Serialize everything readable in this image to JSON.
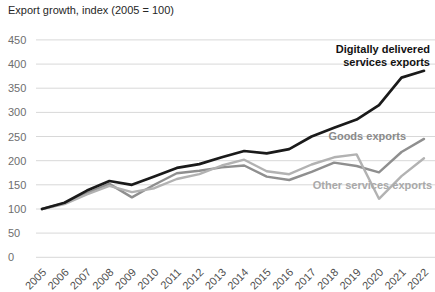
{
  "chart_data": {
    "type": "line",
    "title": "Export growth, index (2005 = 100)",
    "xlabel": "",
    "ylabel": "",
    "ylim": [
      0,
      450
    ],
    "yticks": [
      0,
      50,
      100,
      150,
      200,
      250,
      300,
      350,
      400,
      450
    ],
    "grid": "horizontal",
    "legend_position": "inline-annotations",
    "categories": [
      "2005",
      "2006",
      "2007",
      "2008",
      "2009",
      "2010",
      "2011",
      "2012",
      "2013",
      "2014",
      "2015",
      "2016",
      "2017",
      "2018",
      "2019",
      "2020",
      "2021",
      "2022"
    ],
    "series": [
      {
        "id": "dds",
        "name": "Digitally delivered services exports",
        "color": "#1a1a1a",
        "values": [
          100,
          113,
          138,
          158,
          150,
          167,
          185,
          193,
          207,
          220,
          215,
          224,
          250,
          268,
          285,
          315,
          372,
          386
        ]
      },
      {
        "id": "goods",
        "name": "Goods exports",
        "color": "#8f8f8f",
        "values": [
          100,
          112,
          133,
          152,
          124,
          150,
          174,
          179,
          186,
          190,
          167,
          160,
          177,
          196,
          189,
          176,
          218,
          245
        ]
      },
      {
        "id": "other-services",
        "name": "Other services exports",
        "color": "#b2b2b2",
        "values": [
          100,
          110,
          130,
          148,
          135,
          143,
          162,
          172,
          190,
          202,
          178,
          172,
          192,
          207,
          213,
          121,
          168,
          205
        ]
      }
    ]
  }
}
